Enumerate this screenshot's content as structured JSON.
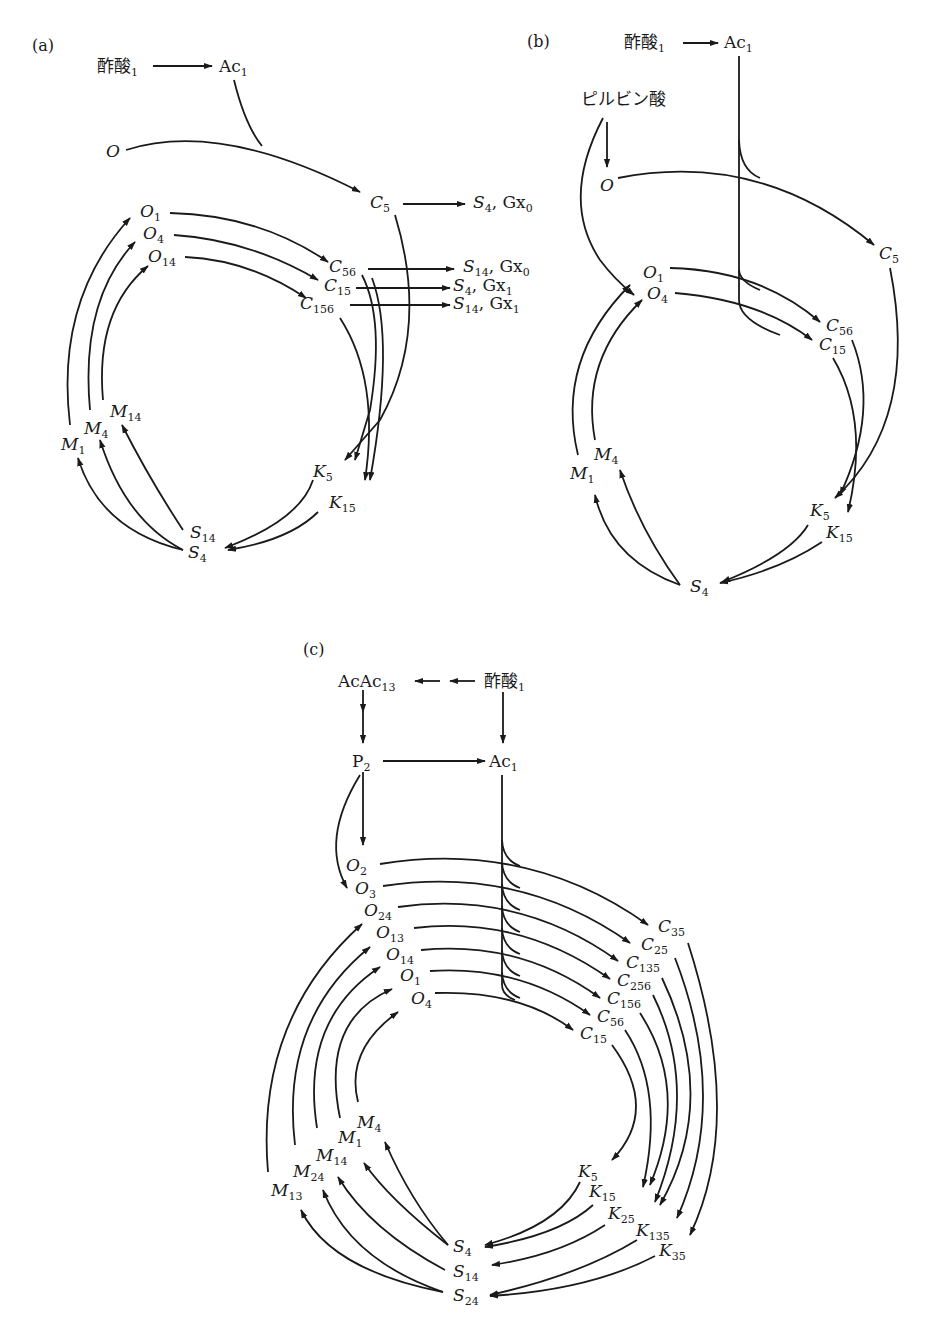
{
  "panels": {
    "a": {
      "label": "(a)",
      "nodes": {
        "acetate": {
          "t": "酢酸",
          "s": "1"
        },
        "ac": {
          "t": "Ac",
          "s": "1"
        },
        "o": {
          "t": "O",
          "s": ""
        },
        "c5": {
          "t": "C",
          "s": "5"
        },
        "out_c5": {
          "t": "S",
          "s": "4",
          "tail": ", Gx",
          "tail_s": "0"
        },
        "o1": {
          "t": "O",
          "s": "1"
        },
        "o4": {
          "t": "O",
          "s": "4"
        },
        "o14": {
          "t": "O",
          "s": "14"
        },
        "c56": {
          "t": "C",
          "s": "56"
        },
        "c15": {
          "t": "C",
          "s": "15"
        },
        "c156": {
          "t": "C",
          "s": "156"
        },
        "out_c56": {
          "t": "S",
          "s": "14",
          "tail": ", Gx",
          "tail_s": "0"
        },
        "out_c15": {
          "t": "S",
          "s": "4",
          "tail": ", Gx",
          "tail_s": "1"
        },
        "out_c156": {
          "t": "S",
          "s": "14",
          "tail": ", Gx",
          "tail_s": "1"
        },
        "m1": {
          "t": "M",
          "s": "1"
        },
        "m4": {
          "t": "M",
          "s": "4"
        },
        "m14": {
          "t": "M",
          "s": "14"
        },
        "k5": {
          "t": "K",
          "s": "5"
        },
        "k15": {
          "t": "K",
          "s": "15"
        },
        "s14": {
          "t": "S",
          "s": "14"
        },
        "s4": {
          "t": "S",
          "s": "4"
        }
      }
    },
    "b": {
      "label": "(b)",
      "nodes": {
        "acetate": {
          "t": "酢酸",
          "s": "1"
        },
        "ac": {
          "t": "Ac",
          "s": "1"
        },
        "pyruvate": {
          "t": "ピルビン酸",
          "s": ""
        },
        "o": {
          "t": "O",
          "s": ""
        },
        "c5": {
          "t": "C",
          "s": "5"
        },
        "o1": {
          "t": "O",
          "s": "1"
        },
        "o4": {
          "t": "O",
          "s": "4"
        },
        "c56": {
          "t": "C",
          "s": "56"
        },
        "c15": {
          "t": "C",
          "s": "15"
        },
        "m4": {
          "t": "M",
          "s": "4"
        },
        "m1": {
          "t": "M",
          "s": "1"
        },
        "k5": {
          "t": "K",
          "s": "5"
        },
        "k15": {
          "t": "K",
          "s": "15"
        },
        "s4": {
          "t": "S",
          "s": "4"
        }
      }
    },
    "c": {
      "label": "(c)",
      "nodes": {
        "acac": {
          "t": "AcAc",
          "s": "13"
        },
        "acetate": {
          "t": "酢酸",
          "s": "1"
        },
        "p2": {
          "t": "P",
          "s": "2"
        },
        "ac": {
          "t": "Ac",
          "s": "1"
        },
        "o2": {
          "t": "O",
          "s": "2"
        },
        "o3": {
          "t": "O",
          "s": "3"
        },
        "o24": {
          "t": "O",
          "s": "24"
        },
        "o13": {
          "t": "O",
          "s": "13"
        },
        "o14": {
          "t": "O",
          "s": "14"
        },
        "o1": {
          "t": "O",
          "s": "1"
        },
        "o4": {
          "t": "O",
          "s": "4"
        },
        "c35": {
          "t": "C",
          "s": "35"
        },
        "c25": {
          "t": "C",
          "s": "25"
        },
        "c135": {
          "t": "C",
          "s": "135"
        },
        "c256": {
          "t": "C",
          "s": "256"
        },
        "c156": {
          "t": "C",
          "s": "156"
        },
        "c56": {
          "t": "C",
          "s": "56"
        },
        "c15": {
          "t": "C",
          "s": "15"
        },
        "m4": {
          "t": "M",
          "s": "4"
        },
        "m1": {
          "t": "M",
          "s": "1"
        },
        "m14": {
          "t": "M",
          "s": "14"
        },
        "m24": {
          "t": "M",
          "s": "24"
        },
        "m13": {
          "t": "M",
          "s": "13"
        },
        "k5": {
          "t": "K",
          "s": "5"
        },
        "k15": {
          "t": "K",
          "s": "15"
        },
        "k25": {
          "t": "K",
          "s": "25"
        },
        "k135": {
          "t": "K",
          "s": "135"
        },
        "k35": {
          "t": "K",
          "s": "35"
        },
        "s4": {
          "t": "S",
          "s": "4"
        },
        "s14": {
          "t": "S",
          "s": "14"
        },
        "s24": {
          "t": "S",
          "s": "24"
        }
      }
    }
  }
}
